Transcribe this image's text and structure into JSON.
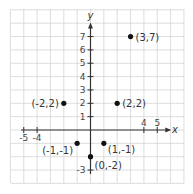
{
  "chart_data": {
    "type": "scatter",
    "title": "",
    "xlabel": "x",
    "ylabel": "y",
    "xlim": [
      -6,
      7
    ],
    "ylim": [
      -4,
      9
    ],
    "grid": true,
    "x_tick_labels": [
      "-5",
      "-4",
      "4",
      "5"
    ],
    "y_tick_labels": [
      "7",
      "6",
      "5",
      "4",
      "3",
      "2",
      "1",
      "-3"
    ],
    "points": [
      {
        "x": 3,
        "y": 7,
        "label": "(3,7)"
      },
      {
        "x": -2,
        "y": 2,
        "label": "(-2,2)"
      },
      {
        "x": 2,
        "y": 2,
        "label": "(2,2)"
      },
      {
        "x": -1,
        "y": -1,
        "label": "(-1,-1)"
      },
      {
        "x": 1,
        "y": -1,
        "label": "(1,-1)"
      },
      {
        "x": 0,
        "y": -2,
        "label": "(0,-2)"
      }
    ]
  },
  "axes": {
    "x_label": "x",
    "y_label": "y"
  },
  "colors": {
    "grid": "#d4d4d4",
    "axis": "#333333",
    "point": "#111111"
  }
}
